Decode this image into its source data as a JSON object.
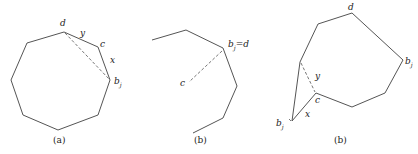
{
  "panels": [
    {
      "caption": "(a)",
      "labels": {
        "d": "d",
        "y": "y",
        "c": "c",
        "x": "x",
        "bj": "b",
        "bj_sub": "j"
      }
    },
    {
      "caption": "(b)",
      "labels": {
        "bj_eq_d": "b",
        "bj_sub": "j",
        "eq_d": "=d",
        "c": "c"
      }
    },
    {
      "caption": "(b)",
      "labels": {
        "d": "d",
        "bj_right": "b",
        "bj_right_sub": "j",
        "y": "y",
        "c": "c",
        "x": "x",
        "bj_left": "b",
        "bj_left_sub": "j"
      }
    }
  ]
}
